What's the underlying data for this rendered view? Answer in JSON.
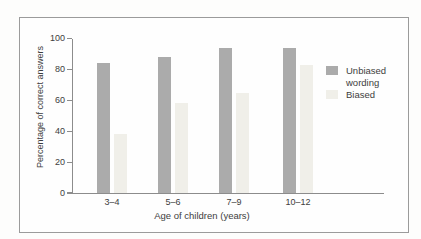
{
  "chart_data": {
    "type": "bar",
    "title": "",
    "categories": [
      "3–4",
      "5–6",
      "7–9",
      "10–12"
    ],
    "series": [
      {
        "name": "Unbiased wording",
        "values": [
          84,
          88,
          94,
          94
        ],
        "color": "#ababab"
      },
      {
        "name": "Biased",
        "values": [
          38,
          58,
          65,
          83
        ],
        "color": "#f0efe9"
      }
    ],
    "xlabel": "Age of children (years)",
    "ylabel": "Percentage of correct answers",
    "ylim": [
      0,
      100
    ],
    "yticks": [
      0,
      20,
      40,
      60,
      80,
      100
    ],
    "grid": false,
    "legend_position": "right"
  },
  "legend": {
    "items": [
      {
        "label": "Unbiased wording",
        "color": "#ababab"
      },
      {
        "label": "Biased",
        "color": "#f0efe9"
      }
    ]
  },
  "colors": {
    "axis": "#8c8c8c",
    "text": "#3d3d3d",
    "frame_border": "#9b9b9b",
    "unbiased_bar": "#ababab",
    "biased_bar": "#f0efe9"
  }
}
